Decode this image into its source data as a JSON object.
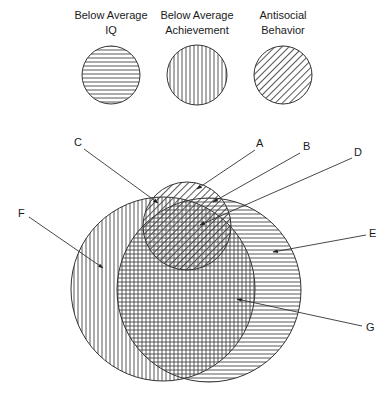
{
  "legend": [
    {
      "line1": "Below Average",
      "line2": "IQ",
      "pattern": "horizontal",
      "cx": 111,
      "cy": 75,
      "r": 29
    },
    {
      "line1": "Below Average",
      "line2": "Achievement",
      "pattern": "vertical",
      "cx": 197,
      "cy": 75,
      "r": 30
    },
    {
      "line1": "Antisocial",
      "line2": "Behavior",
      "pattern": "diagonal",
      "cx": 283,
      "cy": 75,
      "r": 29
    }
  ],
  "venn": {
    "circles": [
      {
        "set": "Below Average Achievement",
        "pattern": "vertical",
        "cx": 163,
        "cy": 289,
        "r": 92
      },
      {
        "set": "Below Average IQ",
        "pattern": "horizontal",
        "cx": 209,
        "cy": 290,
        "r": 92
      },
      {
        "set": "Antisocial Behavior",
        "pattern": "diagonal",
        "cx": 187,
        "cy": 226,
        "r": 44
      }
    ],
    "labels": [
      {
        "text": "A",
        "x": 256,
        "y": 147,
        "from": [
          255,
          150
        ],
        "to": [
          197,
          189
        ]
      },
      {
        "text": "B",
        "x": 303,
        "y": 150,
        "from": [
          300,
          153
        ],
        "to": [
          213,
          202
        ]
      },
      {
        "text": "C",
        "x": 74,
        "y": 146,
        "from": [
          84,
          149
        ],
        "to": [
          158,
          203
        ]
      },
      {
        "text": "D",
        "x": 354,
        "y": 156,
        "from": [
          352,
          158
        ],
        "to": [
          200,
          225
        ]
      },
      {
        "text": "E",
        "x": 369,
        "y": 237,
        "from": [
          366,
          235
        ],
        "to": [
          273,
          252
        ]
      },
      {
        "text": "F",
        "x": 18,
        "y": 217,
        "from": [
          29,
          217
        ],
        "to": [
          103,
          268
        ]
      },
      {
        "text": "G",
        "x": 366,
        "y": 331,
        "from": [
          362,
          326
        ],
        "to": [
          237,
          299
        ]
      }
    ]
  },
  "colors": {
    "stroke": "#333333",
    "hatch": "#444444",
    "background": "#ffffff"
  }
}
